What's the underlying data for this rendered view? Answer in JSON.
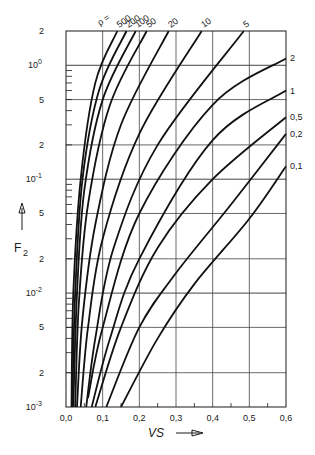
{
  "chart_data": {
    "type": "line",
    "title": "",
    "xlabel": "VS",
    "ylabel": "F2",
    "xscale": "linear",
    "yscale": "log",
    "xlim": [
      0.0,
      0.6
    ],
    "ylim": [
      0.001,
      2
    ],
    "grid": true,
    "legend_position": "inline labels at curve ends",
    "x_ticks": [
      "0,0",
      "0,1",
      "0,2",
      "0,3",
      "0,4",
      "0,5",
      "0,6"
    ],
    "y_ticks": [
      "10^-3",
      "2",
      "5",
      "10^-2",
      "2",
      "5",
      "10^-1",
      "2",
      "5",
      "10^0",
      "2"
    ],
    "parameter_label": "ρ =",
    "series": [
      {
        "name": "500",
        "points": [
          [
            0.015,
            0.001
          ],
          [
            0.02,
            0.01
          ],
          [
            0.04,
            0.1
          ],
          [
            0.08,
            0.7
          ],
          [
            0.14,
            2.0
          ]
        ]
      },
      {
        "name": "200",
        "points": [
          [
            0.017,
            0.001
          ],
          [
            0.025,
            0.01
          ],
          [
            0.045,
            0.1
          ],
          [
            0.09,
            0.6
          ],
          [
            0.165,
            2.0
          ]
        ]
      },
      {
        "name": "100",
        "points": [
          [
            0.02,
            0.001
          ],
          [
            0.03,
            0.01
          ],
          [
            0.05,
            0.08
          ],
          [
            0.1,
            0.5
          ],
          [
            0.19,
            2.0
          ]
        ]
      },
      {
        "name": "50",
        "points": [
          [
            0.025,
            0.001
          ],
          [
            0.035,
            0.008
          ],
          [
            0.06,
            0.06
          ],
          [
            0.12,
            0.45
          ],
          [
            0.22,
            2.0
          ]
        ]
      },
      {
        "name": "20",
        "points": [
          [
            0.03,
            0.001
          ],
          [
            0.045,
            0.006
          ],
          [
            0.08,
            0.04
          ],
          [
            0.15,
            0.3
          ],
          [
            0.28,
            2.0
          ]
        ]
      },
      {
        "name": "10",
        "points": [
          [
            0.04,
            0.001
          ],
          [
            0.06,
            0.005
          ],
          [
            0.1,
            0.03
          ],
          [
            0.2,
            0.25
          ],
          [
            0.37,
            2.0
          ]
        ]
      },
      {
        "name": "5",
        "points": [
          [
            0.055,
            0.001
          ],
          [
            0.08,
            0.004
          ],
          [
            0.13,
            0.025
          ],
          [
            0.25,
            0.2
          ],
          [
            0.485,
            2.0
          ]
        ]
      },
      {
        "name": "2",
        "points": [
          [
            0.06,
            0.0012
          ],
          [
            0.1,
            0.005
          ],
          [
            0.2,
            0.05
          ],
          [
            0.4,
            0.45
          ],
          [
            0.6,
            1.15
          ]
        ]
      },
      {
        "name": "1",
        "points": [
          [
            0.07,
            0.001
          ],
          [
            0.12,
            0.004
          ],
          [
            0.2,
            0.02
          ],
          [
            0.4,
            0.22
          ],
          [
            0.6,
            0.6
          ]
        ]
      },
      {
        "name": "0,5",
        "points": [
          [
            0.08,
            0.001
          ],
          [
            0.15,
            0.005
          ],
          [
            0.25,
            0.025
          ],
          [
            0.4,
            0.1
          ],
          [
            0.6,
            0.35
          ]
        ]
      },
      {
        "name": "0,2",
        "points": [
          [
            0.11,
            0.001
          ],
          [
            0.2,
            0.005
          ],
          [
            0.3,
            0.015
          ],
          [
            0.45,
            0.06
          ],
          [
            0.6,
            0.25
          ]
        ]
      },
      {
        "name": "0,1",
        "points": [
          [
            0.15,
            0.001
          ],
          [
            0.25,
            0.004
          ],
          [
            0.35,
            0.012
          ],
          [
            0.5,
            0.045
          ],
          [
            0.6,
            0.13
          ]
        ]
      }
    ]
  },
  "labels": {
    "y_axis_title": "F",
    "y_axis_sub": "2",
    "x_axis_title": "VS",
    "rho_prefix": "ρ ="
  }
}
